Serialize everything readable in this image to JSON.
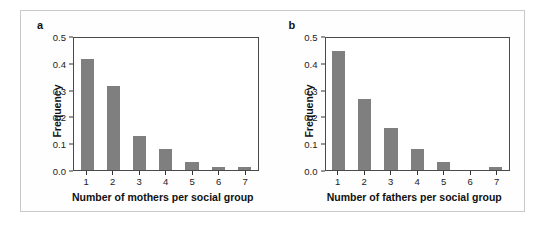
{
  "figure": {
    "panels": [
      {
        "label": "a",
        "chart_index": 0
      },
      {
        "label": "b",
        "chart_index": 1
      }
    ]
  },
  "chart_data": [
    {
      "type": "bar",
      "panel_label": "a",
      "title": "",
      "xlabel": "Number of mothers per social group",
      "ylabel": "Frequency",
      "categories": [
        "1",
        "2",
        "3",
        "4",
        "5",
        "6",
        "7"
      ],
      "values": [
        0.42,
        0.32,
        0.13,
        0.08,
        0.03,
        0.01,
        0.01
      ],
      "ylim": [
        0.0,
        0.5
      ],
      "yticks": [
        "0.0",
        "0.1",
        "0.2",
        "0.3",
        "0.4",
        "0.5"
      ],
      "ytick_values": [
        0.0,
        0.1,
        0.2,
        0.3,
        0.4,
        0.5
      ],
      "grid": false,
      "legend": "none",
      "bar_color": "#7f7f7f"
    },
    {
      "type": "bar",
      "panel_label": "b",
      "title": "",
      "xlabel": "Number of fathers per social group",
      "ylabel": "Frequency",
      "categories": [
        "1",
        "2",
        "3",
        "4",
        "5",
        "6",
        "7"
      ],
      "values": [
        0.45,
        0.27,
        0.16,
        0.08,
        0.03,
        0.0,
        0.01
      ],
      "ylim": [
        0.0,
        0.5
      ],
      "yticks": [
        "0.0",
        "0.1",
        "0.2",
        "0.3",
        "0.4",
        "0.5"
      ],
      "ytick_values": [
        0.0,
        0.1,
        0.2,
        0.3,
        0.4,
        0.5
      ],
      "grid": false,
      "legend": "none",
      "bar_color": "#7f7f7f"
    }
  ],
  "colors": {
    "bar": "#7f7f7f",
    "axis": "#4a4a4a",
    "text": "#111111",
    "figure_border": "#c9c9c9"
  }
}
